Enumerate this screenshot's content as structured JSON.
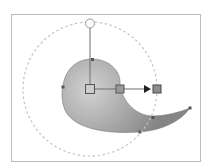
{
  "diagram": {
    "colors": {
      "background": "#ffffff",
      "frame": "#bdbdbd",
      "dashed_circle": "#c4c4c4",
      "shape_light": "#d0d0d0",
      "shape_dark": "#8c8c8c",
      "handle_line": "#707070",
      "handle_fill": "#9a9a9a",
      "arrow": "#222222"
    },
    "handles": [
      {
        "name": "center-handle",
        "shape": "square",
        "filled": false
      },
      {
        "name": "focus-handle",
        "shape": "square",
        "filled": true
      },
      {
        "name": "radius-end-handle",
        "shape": "square",
        "filled": true
      },
      {
        "name": "rotation-handle",
        "shape": "circle",
        "filled": false
      }
    ],
    "direction_arrow": "right"
  }
}
